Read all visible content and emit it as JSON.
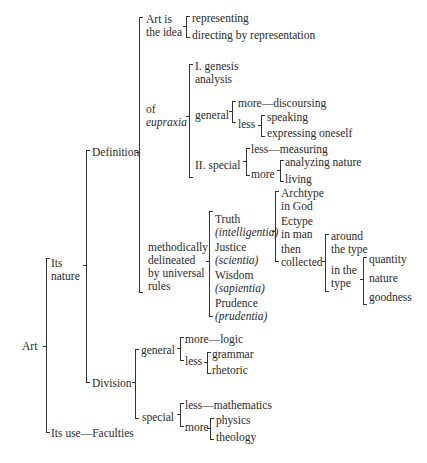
{
  "root": "Art",
  "level1": {
    "nature": [
      "Its",
      "nature"
    ],
    "use": "Its use—Faculties"
  },
  "level2": {
    "definition": "Definition",
    "division": "Division"
  },
  "definition": {
    "idea": {
      "label": [
        "Art is",
        "the idea"
      ],
      "items": [
        "representing",
        "directing by representation"
      ]
    },
    "eupraxia": {
      "label": [
        "of",
        "eupraxia"
      ],
      "genesis": [
        "I. genesis",
        "analysis"
      ],
      "general": {
        "label": "general",
        "more": "more—discoursing",
        "less": "less",
        "less_items": [
          "speaking",
          "expressing oneself"
        ]
      },
      "special": {
        "label": "II. special",
        "less": "less—measuring",
        "more": "more",
        "more_items": [
          "analyzing nature",
          "living"
        ]
      }
    },
    "method": {
      "label": [
        "methodically",
        "delineated",
        "by universal",
        "rules"
      ],
      "virtues": [
        {
          "name": "Truth",
          "latin": "(intelligentia)"
        },
        {
          "name": "Justice",
          "latin": "(scientia)"
        },
        {
          "name": "Wisdom",
          "latin": "(sapientia)"
        },
        {
          "name": "Prudence",
          "latin": "(prudentia)"
        }
      ],
      "types": [
        [
          "Archtype",
          "in God"
        ],
        [
          "Ectype",
          "in man"
        ],
        [
          "then",
          "collected"
        ]
      ],
      "collected": {
        "around": [
          "around",
          "the type"
        ],
        "in": [
          "in the",
          "type"
        ],
        "in_items": [
          "quantity",
          "nature",
          "goodness"
        ]
      }
    }
  },
  "division": {
    "general": {
      "label": "general",
      "more": "more—logic",
      "less": "less",
      "less_items": [
        "grammar",
        "rhetoric"
      ]
    },
    "special": {
      "label": "special",
      "less": "less—mathematics",
      "more": "more",
      "more_items": [
        "physics",
        "theology"
      ]
    }
  }
}
